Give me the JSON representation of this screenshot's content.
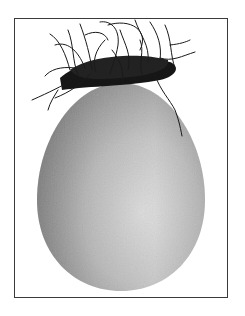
{
  "image": {
    "subject": "egg-with-hair-nest",
    "description": "Grayscale photograph of an egg topped with a tangle of dark hair, inside a thin black border",
    "colors": {
      "background": "#ffffff",
      "frame": "#3a3a3a",
      "egg_light": "#d8d8d8",
      "egg_dark": "#8e8e8e",
      "hair": "#1a1a1a"
    }
  }
}
